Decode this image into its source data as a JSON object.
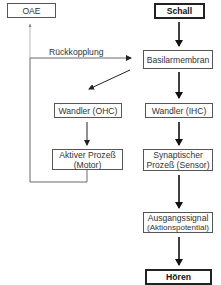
{
  "diagram": {
    "nodes": {
      "oae": "OAE",
      "schall": "Schall",
      "basilarmembran": "Basilarmembran",
      "wandler_ohc": "Wandler (OHC)",
      "wandler_ihc": "Wandler (IHC)",
      "aktiver_prozess_l1": "Aktiver Prozeß",
      "aktiver_prozess_l2": "(Motor)",
      "synaptischer_l1": "Synaptischer",
      "synaptischer_l2": "Prozeß (Sensor)",
      "ausgangssignal_l1": "Ausgangssignal",
      "ausgangssignal_l2": "(Aktionspotential)",
      "hoeren": "Hören"
    },
    "labels": {
      "feedback": "Rückkopplung"
    },
    "edges": [
      {
        "from": "Schall",
        "to": "Basilarmembran"
      },
      {
        "from": "Basilarmembran",
        "to": "Wandler (OHC)"
      },
      {
        "from": "Basilarmembran",
        "to": "Wandler (IHC)"
      },
      {
        "from": "Wandler (OHC)",
        "to": "Aktiver Prozeß (Motor)"
      },
      {
        "from": "Wandler (IHC)",
        "to": "Synaptischer Prozeß (Sensor)"
      },
      {
        "from": "Synaptischer Prozeß (Sensor)",
        "to": "Ausgangssignal (Aktionspotential)"
      },
      {
        "from": "Ausgangssignal (Aktionspotential)",
        "to": "Hören"
      },
      {
        "from": "Aktiver Prozeß (Motor)",
        "to": "Basilarmembran",
        "label": "Rückkopplung"
      },
      {
        "from": "Aktiver Prozeß (Motor)",
        "to": "OAE"
      }
    ]
  }
}
